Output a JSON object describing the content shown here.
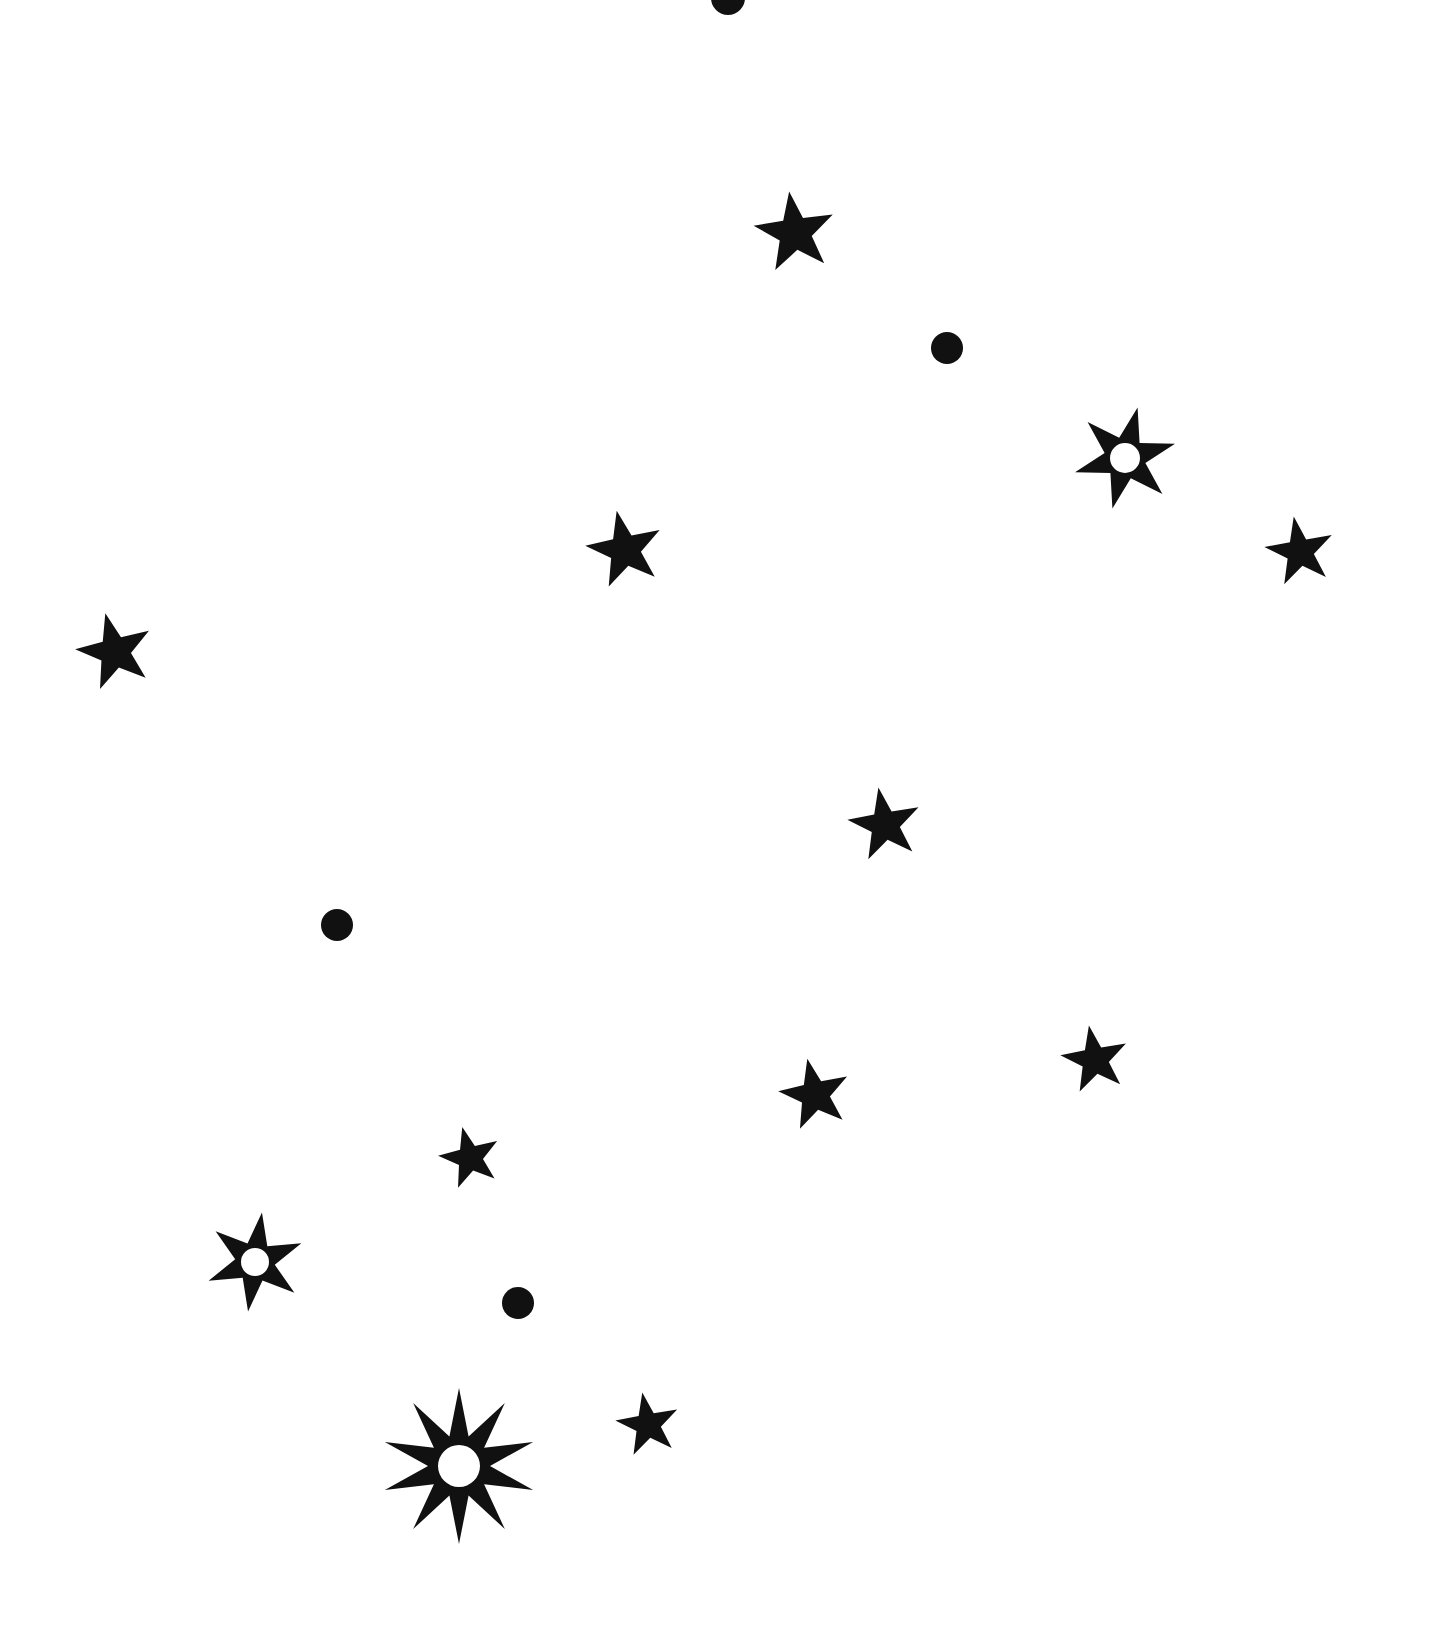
{
  "canvas": {
    "width": 1447,
    "height": 1631,
    "background_color": "#ffffff",
    "ink_color": "#111111",
    "title": "Star Field Illustration"
  },
  "palette": {
    "ink": "#111111",
    "paper": "#ffffff"
  },
  "shapes": [
    {
      "id": "dot-top-edge",
      "kind": "dot",
      "icon": "filled-circle-icon",
      "cx": 728,
      "cy": -2,
      "r": 17,
      "color": "#111111",
      "clipped": true
    },
    {
      "id": "star-upper-center",
      "kind": "star",
      "icon": "five-point-star-icon",
      "cx": 795,
      "cy": 233,
      "points": 5,
      "outer_r": 42,
      "inner_r": 17,
      "rotation": -8,
      "hole_r": 0,
      "color": "#111111"
    },
    {
      "id": "dot-upper-right",
      "kind": "dot",
      "icon": "filled-circle-icon",
      "cx": 947,
      "cy": 348,
      "r": 16,
      "color": "#111111"
    },
    {
      "id": "star-holed-upper-right",
      "kind": "star",
      "icon": "six-point-star-hole-icon",
      "cx": 1125,
      "cy": 458,
      "points": 6,
      "outer_r": 52,
      "inner_r": 21,
      "rotation": 14,
      "hole_r": 15,
      "color": "#111111"
    },
    {
      "id": "star-mid-left-center",
      "kind": "star",
      "icon": "five-point-star-icon",
      "cx": 625,
      "cy": 550,
      "points": 5,
      "outer_r": 40,
      "inner_r": 16,
      "rotation": -12,
      "hole_r": 0,
      "color": "#111111"
    },
    {
      "id": "star-far-right",
      "kind": "star",
      "icon": "five-point-star-icon",
      "cx": 1300,
      "cy": 552,
      "points": 5,
      "outer_r": 36,
      "inner_r": 14,
      "rotation": -10,
      "hole_r": 0,
      "color": "#111111"
    },
    {
      "id": "star-far-left",
      "kind": "star",
      "icon": "five-point-star-icon",
      "cx": 115,
      "cy": 652,
      "points": 5,
      "outer_r": 40,
      "inner_r": 16,
      "rotation": -14,
      "hole_r": 0,
      "color": "#111111"
    },
    {
      "id": "star-middle",
      "kind": "star",
      "icon": "five-point-star-icon",
      "cx": 885,
      "cy": 825,
      "points": 5,
      "outer_r": 38,
      "inner_r": 15,
      "rotation": -10,
      "hole_r": 0,
      "color": "#111111"
    },
    {
      "id": "dot-mid-left",
      "kind": "dot",
      "icon": "filled-circle-icon",
      "cx": 337,
      "cy": 925,
      "r": 16,
      "color": "#111111"
    },
    {
      "id": "star-lower-right-upper",
      "kind": "star",
      "icon": "five-point-star-icon",
      "cx": 1095,
      "cy": 1060,
      "points": 5,
      "outer_r": 35,
      "inner_r": 14,
      "rotation": -10,
      "hole_r": 0,
      "color": "#111111"
    },
    {
      "id": "star-lower-center-right",
      "kind": "star",
      "icon": "five-point-star-icon",
      "cx": 815,
      "cy": 1095,
      "points": 5,
      "outer_r": 37,
      "inner_r": 15,
      "rotation": -12,
      "hole_r": 0,
      "color": "#111111"
    },
    {
      "id": "star-lower-center-left",
      "kind": "star",
      "icon": "five-point-star-icon",
      "cx": 470,
      "cy": 1158,
      "points": 5,
      "outer_r": 32,
      "inner_r": 13,
      "rotation": -14,
      "hole_r": 0,
      "color": "#111111"
    },
    {
      "id": "star-holed-lower-left",
      "kind": "star",
      "icon": "six-point-star-hole-icon",
      "cx": 255,
      "cy": 1262,
      "points": 6,
      "outer_r": 50,
      "inner_r": 20,
      "rotation": 8,
      "hole_r": 14,
      "color": "#111111"
    },
    {
      "id": "dot-bottom-center",
      "kind": "dot",
      "icon": "filled-circle-icon",
      "cx": 518,
      "cy": 1303,
      "r": 16,
      "color": "#111111"
    },
    {
      "id": "burst-bottom-left",
      "kind": "star",
      "icon": "ten-point-burst-hole-icon",
      "cx": 459,
      "cy": 1466,
      "points": 10,
      "outer_r": 78,
      "inner_r": 31,
      "rotation": 0,
      "hole_r": 21,
      "color": "#111111"
    },
    {
      "id": "star-bottom-right",
      "kind": "star",
      "icon": "five-point-star-icon",
      "cx": 648,
      "cy": 1425,
      "points": 5,
      "outer_r": 33,
      "inner_r": 13,
      "rotation": -10,
      "hole_r": 0,
      "color": "#111111"
    }
  ]
}
